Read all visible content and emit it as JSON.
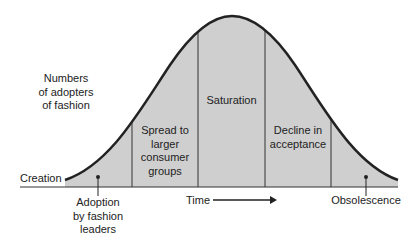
{
  "y_axis_label": [
    "Numbers",
    "of adopters",
    "of fashion"
  ],
  "x_axis_label": "Time",
  "start_label": "Creation",
  "stages": [
    {
      "name": "adoption",
      "lines": [
        "Adoption",
        "by fashion",
        "leaders"
      ]
    },
    {
      "name": "spread",
      "lines": [
        "Spread to",
        "larger",
        "consumer",
        "groups"
      ]
    },
    {
      "name": "saturation",
      "lines": [
        "Saturation"
      ]
    },
    {
      "name": "decline",
      "lines": [
        "Decline in",
        "acceptance"
      ]
    },
    {
      "name": "obsolescence",
      "lines": [
        "Obsolescence"
      ]
    }
  ],
  "colors": {
    "fill": "#cfcfcf",
    "curve": "#222222",
    "line": "#333333"
  }
}
